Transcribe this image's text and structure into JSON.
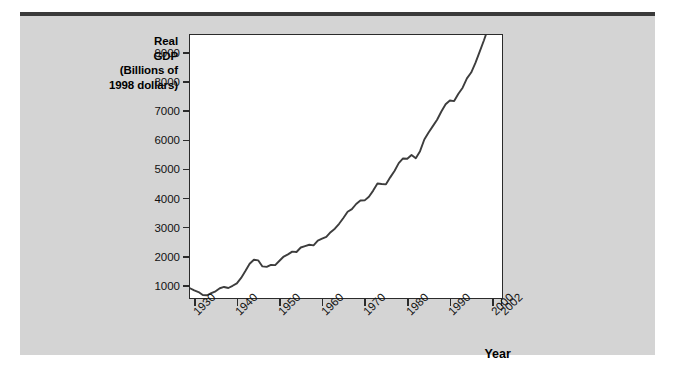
{
  "chart_data": {
    "type": "line",
    "title": "",
    "ylabel": "Real GDP (Billions of 1998 dollars)",
    "ylabel_lines": [
      "Real",
      "GDP",
      "(Billions of",
      "1998 dollars)"
    ],
    "xlabel": "Year",
    "xlim": [
      1929,
      2002
    ],
    "ylim": [
      600,
      9600
    ],
    "grid": false,
    "legend": null,
    "yticks": [
      1000,
      2000,
      3000,
      4000,
      5000,
      6000,
      7000,
      8000,
      9000
    ],
    "ytick_labels": [
      "1000",
      "2000",
      "3000",
      "4000",
      "5000",
      "6000",
      "7000",
      "8000",
      "9000"
    ],
    "xticks": [
      1930,
      1940,
      1950,
      1960,
      1970,
      1980,
      1990,
      2000,
      2002
    ],
    "xtick_labels": [
      "1930",
      "1940",
      "1950",
      "1960",
      "1970",
      "1980",
      "1990",
      "2000",
      "2002"
    ],
    "line_color": "#3d3d3d",
    "series": [
      {
        "name": "Real GDP",
        "x": [
          1929,
          1930,
          1931,
          1932,
          1933,
          1934,
          1935,
          1936,
          1937,
          1938,
          1939,
          1940,
          1941,
          1942,
          1943,
          1944,
          1945,
          1946,
          1947,
          1948,
          1949,
          1950,
          1951,
          1952,
          1953,
          1954,
          1955,
          1956,
          1957,
          1958,
          1959,
          1960,
          1961,
          1962,
          1963,
          1964,
          1965,
          1966,
          1967,
          1968,
          1969,
          1970,
          1971,
          1972,
          1973,
          1974,
          1975,
          1976,
          1977,
          1978,
          1979,
          1980,
          1981,
          1982,
          1983,
          1984,
          1985,
          1986,
          1987,
          1988,
          1989,
          1990,
          1991,
          1992,
          1993,
          1994,
          1995,
          1996,
          1997,
          1998,
          1999,
          2000
        ],
        "values": [
          900,
          825,
          770,
          670,
          660,
          730,
          795,
          900,
          945,
          910,
          985,
          1070,
          1255,
          1490,
          1740,
          1880,
          1860,
          1650,
          1635,
          1705,
          1695,
          1845,
          1990,
          2065,
          2160,
          2145,
          2300,
          2350,
          2395,
          2375,
          2540,
          2605,
          2665,
          2825,
          2945,
          3115,
          3315,
          3530,
          3620,
          3795,
          3915,
          3920,
          4045,
          4255,
          4500,
          4480,
          4470,
          4710,
          4930,
          5200,
          5360,
          5350,
          5480,
          5370,
          5610,
          6010,
          6250,
          6470,
          6690,
          6970,
          7220,
          7350,
          7330,
          7580,
          7790,
          8110,
          8310,
          8640,
          9030,
          9420,
          9840,
          10220
        ]
      }
    ],
    "annotations": []
  },
  "figure": {
    "background_color": "#d4d4d4",
    "plot_background_color": "#ffffff",
    "frame_color": "#2b2b2b"
  }
}
